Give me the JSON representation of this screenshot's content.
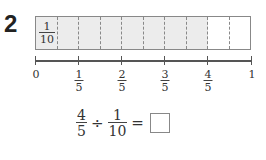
{
  "question_number": "2",
  "tape_diagram": {
    "total_parts": 10,
    "shaded_parts": 8,
    "first_cell_label": {
      "numerator": "1",
      "denominator": "10"
    }
  },
  "number_line": {
    "labels": [
      {
        "text": "0",
        "pos": 0
      },
      {
        "numerator": "1",
        "denominator": "5",
        "pos": 0.2
      },
      {
        "numerator": "2",
        "denominator": "5",
        "pos": 0.4
      },
      {
        "numerator": "3",
        "denominator": "5",
        "pos": 0.6
      },
      {
        "numerator": "4",
        "denominator": "5",
        "pos": 0.8
      },
      {
        "text": "1",
        "pos": 1
      }
    ]
  },
  "equation": {
    "left": {
      "numerator": "4",
      "denominator": "5"
    },
    "operator": "÷",
    "right": {
      "numerator": "1",
      "denominator": "10"
    },
    "equals": "=",
    "answer": ""
  }
}
